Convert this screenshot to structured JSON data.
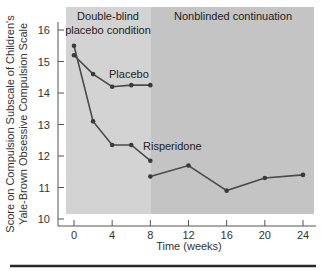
{
  "chart_data": {
    "type": "line",
    "title": "",
    "xlabel": "Time (weeks)",
    "ylabel_lines": [
      "Score on Compulsion Subscale of Children's",
      "Yale-Brown Obsessive Compulsion Scale"
    ],
    "ylabel": "Score on Compulsion Subscale of Children's Yale-Brown Obsessive Compulsion Scale",
    "xlim": [
      0,
      24
    ],
    "ylim": [
      10,
      16
    ],
    "x_ticks": [
      0,
      4,
      8,
      12,
      16,
      20,
      24
    ],
    "y_ticks": [
      10,
      11,
      12,
      13,
      14,
      15,
      16
    ],
    "grid": false,
    "regions": [
      {
        "name": "double-blind",
        "label_lines": [
          "Double-blind",
          "placebo condition"
        ],
        "x_range": [
          0,
          8
        ],
        "color": "#d3d3d3"
      },
      {
        "name": "nonblinded",
        "label_lines": [
          "Nonblinded continuation"
        ],
        "x_range": [
          8,
          24
        ],
        "color": "#c4c4c4"
      }
    ],
    "series": [
      {
        "name": "Placebo",
        "x": [
          0,
          2,
          4,
          6,
          8
        ],
        "values": [
          15.2,
          14.6,
          14.2,
          14.25,
          14.25
        ]
      },
      {
        "name": "Risperidone",
        "x": [
          0,
          2,
          4,
          6,
          8
        ],
        "values": [
          15.5,
          13.1,
          12.35,
          12.35,
          11.85
        ]
      },
      {
        "name": "Nonblinded continuation",
        "x": [
          8,
          12,
          16,
          20,
          24
        ],
        "values": [
          11.35,
          11.7,
          10.9,
          11.3,
          11.4
        ]
      }
    ],
    "annotations": [
      {
        "text": "Placebo",
        "x": 5,
        "y": 14.7
      },
      {
        "text": "Risperidone",
        "x": 8.5,
        "y": 12.15
      }
    ],
    "legend": "none (inline labels)"
  },
  "colors": {
    "line": "#4a4a4a",
    "marker": "#3a3a3a",
    "axis": "#555555",
    "region_left": "#d3d3d3",
    "region_right": "#c4c4c4",
    "rule": "#2a2a2a"
  }
}
